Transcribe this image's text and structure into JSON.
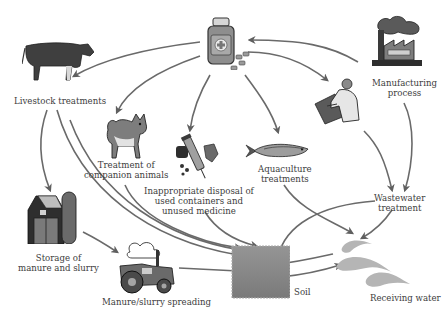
{
  "diagram": {
    "colors": {
      "background": "#ffffff",
      "arrow": "#5f5f5f",
      "text": "#3d3d3d",
      "soil": "#8a8a8a",
      "water": "#b8b8b8",
      "icon_dark": "#3a3a3a",
      "icon_mid": "#7a7a7a"
    },
    "nodes": [
      {
        "id": "medicine",
        "icon": "medicine-bottle-icon",
        "label": ""
      },
      {
        "id": "livestock",
        "icon": "cow-icon",
        "label": "Livestock treatments"
      },
      {
        "id": "companion",
        "icon": "dog-icon",
        "label_lines": [
          "Treatment of",
          "companion animals"
        ]
      },
      {
        "id": "disposal",
        "icon": "syringe-waste-icon",
        "label_lines": [
          "Inappropriate disposal of",
          "used containers and",
          "unused medicine"
        ]
      },
      {
        "id": "aquaculture",
        "icon": "fish-icon",
        "label_lines": [
          "Aquaculture",
          "treatments"
        ]
      },
      {
        "id": "pharmacist",
        "icon": "pharmacist-icon",
        "label": ""
      },
      {
        "id": "manufacturing",
        "icon": "factory-icon",
        "label_lines": [
          "Manufacturing",
          "process"
        ]
      },
      {
        "id": "storage",
        "icon": "barn-icon",
        "label_lines": [
          "Storage of",
          "manure and slurry"
        ]
      },
      {
        "id": "spreading",
        "icon": "tractor-icon",
        "label": "Manure/slurry spreading"
      },
      {
        "id": "wastewater",
        "icon": "",
        "label_lines": [
          "Wastewater",
          "treatment"
        ]
      },
      {
        "id": "soil",
        "icon": "soil-block-icon",
        "label": "Soil"
      },
      {
        "id": "water",
        "icon": "water-waves-icon",
        "label": "Receiving water"
      }
    ],
    "edges": [
      {
        "from": "manufacturing",
        "to": "medicine"
      },
      {
        "from": "medicine",
        "to": "livestock"
      },
      {
        "from": "medicine",
        "to": "companion"
      },
      {
        "from": "medicine",
        "to": "disposal"
      },
      {
        "from": "medicine",
        "to": "aquaculture"
      },
      {
        "from": "medicine",
        "to": "pharmacist"
      },
      {
        "from": "livestock",
        "to": "storage"
      },
      {
        "from": "livestock",
        "to": "soil"
      },
      {
        "from": "storage",
        "to": "spreading"
      },
      {
        "from": "spreading",
        "to": "soil"
      },
      {
        "from": "companion",
        "to": "soil"
      },
      {
        "from": "disposal",
        "to": "soil"
      },
      {
        "from": "aquaculture",
        "to": "water"
      },
      {
        "from": "pharmacist",
        "to": "wastewater"
      },
      {
        "from": "manufacturing",
        "to": "wastewater"
      },
      {
        "from": "wastewater",
        "to": "soil"
      },
      {
        "from": "wastewater",
        "to": "water"
      },
      {
        "from": "soil",
        "to": "water"
      },
      {
        "from": "water",
        "to": "soil"
      }
    ]
  }
}
